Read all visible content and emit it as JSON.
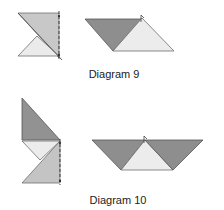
{
  "diagrams": [
    {
      "caption": "Diagram 9",
      "left_figure": {
        "shapes": [
          {
            "name": "upper-right-triangle",
            "points": "18,13 59,13 59,58",
            "fill": "#c8c8c8"
          },
          {
            "name": "lower-small-triangle",
            "points": "18,56 37,36 59,56",
            "fill": "#ebebeb"
          }
        ],
        "fold_line": {
          "x": 59,
          "y1": 11,
          "y2": 61,
          "style": "dashed"
        }
      },
      "right_figure": {
        "shapes": [
          {
            "name": "dark-triangle",
            "points": "85,19 142,19 113,51",
            "fill": "#8e8e8e"
          },
          {
            "name": "light-triangle",
            "points": "113,51 142,18 174,51",
            "fill": "#ececec"
          }
        ]
      }
    },
    {
      "caption": "Diagram 10",
      "left_figure": {
        "shapes": [
          {
            "name": "top-dark-triangle",
            "points": "22,98 22,140 60,140",
            "fill": "#929292"
          },
          {
            "name": "middle-light-triangle",
            "points": "22,141 60,141 40,160",
            "fill": "#ececec"
          },
          {
            "name": "bottom-medium-triangle",
            "points": "22,183 60,141 60,183",
            "fill": "#c4c4c4"
          }
        ],
        "fold_line": {
          "x": 60,
          "y1": 139,
          "y2": 185,
          "style": "dashed"
        }
      },
      "right_figure": {
        "shapes": [
          {
            "name": "left-dark-triangle",
            "points": "92,140 145,140 121,170",
            "fill": "#8e8e8e"
          },
          {
            "name": "middle-light-triangle",
            "points": "121,170 145,140 173,170",
            "fill": "#ececec"
          },
          {
            "name": "right-dark-triangle",
            "points": "145,140 203,140 173,170",
            "fill": "#8e8e8e"
          }
        ]
      }
    }
  ]
}
